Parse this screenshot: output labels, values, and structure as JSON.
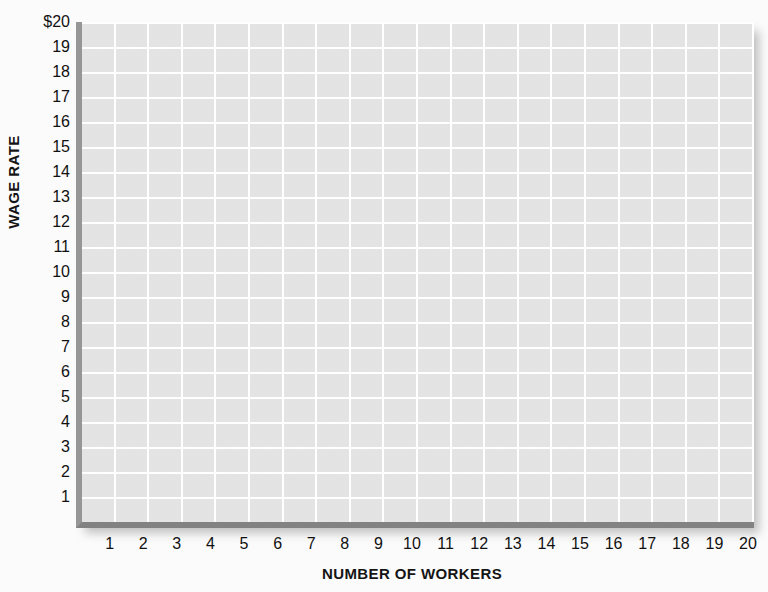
{
  "chart_data": {
    "type": "grid",
    "title": "",
    "subtitle": "",
    "xlabel": "NUMBER OF WORKERS",
    "ylabel": "WAGE RATE",
    "xlim": [
      0,
      20
    ],
    "ylim": [
      0,
      20
    ],
    "grid": true,
    "legend": null,
    "series": [],
    "values": [],
    "categories": [],
    "annotations": [],
    "x_tick_labels": [
      "1",
      "2",
      "3",
      "4",
      "5",
      "6",
      "7",
      "8",
      "9",
      "10",
      "11",
      "12",
      "13",
      "14",
      "15",
      "16",
      "17",
      "18",
      "19",
      "20"
    ],
    "y_tick_labels": [
      "$20",
      "19",
      "18",
      "17",
      "16",
      "15",
      "14",
      "13",
      "12",
      "11",
      "10",
      "9",
      "8",
      "7",
      "6",
      "5",
      "4",
      "3",
      "2",
      "1"
    ],
    "x_tick_values": [
      1,
      2,
      3,
      4,
      5,
      6,
      7,
      8,
      9,
      10,
      11,
      12,
      13,
      14,
      15,
      16,
      17,
      18,
      19,
      20
    ],
    "y_tick_values": [
      20,
      19,
      18,
      17,
      16,
      15,
      14,
      13,
      12,
      11,
      10,
      9,
      8,
      7,
      6,
      5,
      4,
      3,
      2,
      1
    ],
    "note": "Empty graph paper grid; no data plotted.",
    "colors": {
      "page_background": "#fbfbfb",
      "plot_background": "#e4e4e4",
      "gridline": "#ffffff",
      "y_axis_bar": "#969696",
      "x_axis_bar": "#828282",
      "text": "#111111"
    }
  }
}
